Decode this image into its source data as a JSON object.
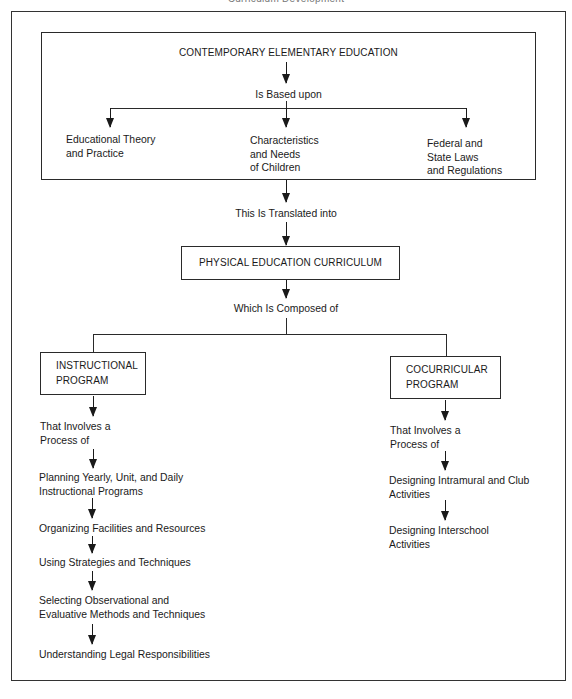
{
  "running_head": "Curriculum Development",
  "top_box": {
    "title": "CONTEMPORARY ELEMENTARY EDUCATION",
    "connector": "Is Based upon",
    "bases": [
      {
        "lines": [
          "Educational Theory",
          "and Practice"
        ]
      },
      {
        "lines": [
          "Characteristics",
          "and Needs",
          "of Children"
        ]
      },
      {
        "lines": [
          "Federal and",
          "State Laws",
          "and Regulations"
        ]
      }
    ]
  },
  "translated": "This Is Translated into",
  "curriculum": {
    "title": "PHYSICAL EDUCATION CURRICULUM",
    "connector": "Which Is Composed of"
  },
  "instructional": {
    "title_lines": [
      "INSTRUCTIONAL",
      "PROGRAM"
    ],
    "process_lines": [
      "That Involves a",
      "Process of"
    ],
    "steps": [
      {
        "lines": [
          "Planning Yearly, Unit, and Daily",
          "Instructional Programs"
        ]
      },
      {
        "lines": [
          "Organizing Facilities and Resources"
        ]
      },
      {
        "lines": [
          "Using Strategies and Techniques"
        ]
      },
      {
        "lines": [
          "Selecting Observational and",
          "Evaluative Methods and Techniques"
        ]
      },
      {
        "lines": [
          "Understanding Legal Responsibilities"
        ]
      }
    ]
  },
  "cocurricular": {
    "title_lines": [
      "COCURRICULAR",
      "PROGRAM"
    ],
    "process_lines": [
      "That Involves a",
      "Process of"
    ],
    "steps": [
      {
        "lines": [
          "Designing Intramural and Club",
          "Activities"
        ]
      },
      {
        "lines": [
          "Designing Interschool",
          "Activities"
        ]
      }
    ]
  }
}
